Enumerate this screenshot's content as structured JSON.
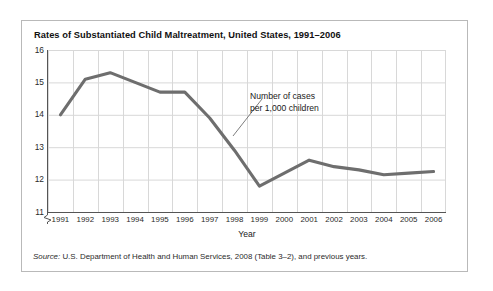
{
  "figure": {
    "title": "Rates of Substantiated Child Maltreatment, United States, 1991–2006",
    "source_label": "Source:",
    "source_text": " U.S. Department of Health and Human Services, 2008 (Table 3–2), and previous years."
  },
  "annotation": {
    "line1": "Number of cases",
    "line2": "per 1,000 children"
  },
  "colors": {
    "series_line": "#6e6e6e",
    "grid": "#d8d8d8",
    "axis": "#555555",
    "frame": "#b9b9b9",
    "text": "#1a1a1a"
  },
  "chart_data": {
    "type": "line",
    "title": "Rates of Substantiated Child Maltreatment, United States, 1991–2006",
    "xlabel": "Year",
    "ylabel": "",
    "categories": [
      "1991",
      "1992",
      "1993",
      "1994",
      "1995",
      "1996",
      "1997",
      "1998",
      "1999",
      "2000",
      "2001",
      "2002",
      "2003",
      "2004",
      "2005",
      "2006"
    ],
    "values": [
      14.0,
      15.1,
      15.3,
      15.0,
      14.7,
      14.7,
      13.9,
      12.9,
      11.8,
      12.2,
      12.6,
      12.4,
      12.3,
      12.15,
      12.2,
      12.25
    ],
    "series": [
      {
        "name": "Number of cases per 1,000 children",
        "values": [
          14.0,
          15.1,
          15.3,
          15.0,
          14.7,
          14.7,
          13.9,
          12.9,
          11.8,
          12.2,
          12.6,
          12.4,
          12.3,
          12.15,
          12.2,
          12.25
        ]
      }
    ],
    "ylim": [
      11,
      16
    ],
    "yticks": [
      16,
      15,
      14,
      13,
      12,
      11
    ],
    "ytick_labels": [
      "16",
      "15",
      "14",
      "13",
      "12",
      "11"
    ],
    "axis_break": true,
    "grid": true,
    "legend": "none",
    "annotations": [
      {
        "text": "Number of cases per 1,000 children",
        "points_to_year": "1998"
      }
    ]
  }
}
